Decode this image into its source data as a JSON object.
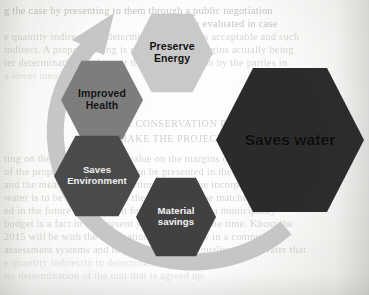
{
  "document": {
    "type": "scanned-book-page",
    "background_color": "#fbfbfa",
    "bleed_through_lines": [
      "g the case by presenting to them through a public negotiation",
      "to be evaluated in case",
      "e quantity indirectly to determine if the case is acceptable and such",
      "indirect. A proper reading is needed on the margins actually being",
      "ter determination of the unit that is agreed upon by the parties in",
      "a lower measure",
      "ting on the case, the overall value on the margins of the adjustment",
      "of the properly agreed value can be presented in the following",
      "and the measure is a small portion that may be incorporated in",
      "water is to be calculated and the quality may be matched in a",
      "ed in the future requirement for the building of a municipality",
      "budget is a fact in the present year of 25 for some time. Khosr the",
      "2015 will be with the application of the supply in a community",
      "assessment systems and improvement of the quality of the water that"
    ],
    "bleed_through_heading_lines": [
      "WATER CONSERVATION PRACTICES THAT",
      "MAKE THE PROJECT SUSTAINABLE"
    ]
  },
  "diagram": {
    "name": "water-conservation-benefits",
    "arrow": {
      "label": "circular-arrow",
      "color": "#c6c6c6",
      "direction": "clockwise"
    },
    "hexagons": [
      {
        "id": "preserve-energy",
        "label": "Preserve\nEnergy",
        "fill": "#c9c9c9",
        "text_color": "#111111",
        "size": "small"
      },
      {
        "id": "improved-health",
        "label": "Improved\nHealth",
        "fill": "#7d7d7d",
        "text_color": "#111111",
        "size": "small"
      },
      {
        "id": "saves-environment",
        "label": "Saves\nEnvironment",
        "fill": "#4a4a4a",
        "text_color": "#ececec",
        "size": "small"
      },
      {
        "id": "material-savings",
        "label": "Material\nsavings",
        "fill": "#414141",
        "text_color": "#f0f0f0",
        "size": "small"
      },
      {
        "id": "saves-water",
        "label": "Saves water",
        "fill": "#2b2b2b",
        "text_color": "#0b0b0b",
        "size": "large"
      }
    ]
  }
}
